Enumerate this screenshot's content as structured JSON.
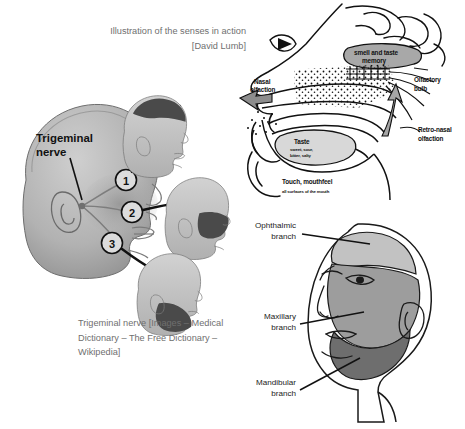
{
  "figure": {
    "background": "#ffffff",
    "width": 465,
    "height": 429
  },
  "captions": {
    "senses": "Illustration of the senses in action [David Lumb]",
    "trigeminal": "Trigeminal nerve [Images – Medical Dictionary – The Free Dictionary – Wikipedia]",
    "color": "#6f6f6f"
  },
  "senses_diagram": {
    "title": "hand-drawn sagittal section of head showing the senses in action",
    "labels": {
      "smell_taste_memory": "smell and taste memory",
      "nasal_olfaction": "Nasal olfaction",
      "olfactory_bulb": "Olfactory bulb",
      "retro_nasal_olfaction": "Retro-nasal olfaction",
      "taste": "Taste",
      "taste_qualities": "sweet, sour, bitter, salty",
      "touch_mouthfeel": "Touch, mouthfeel",
      "touch_surfaces": "all surfaces of the mouth"
    }
  },
  "trigeminal_diagram": {
    "title": "Trigeminal nerve",
    "nerve_label": "Trigeminal\nnerve",
    "markers": [
      {
        "number": "1",
        "branch": "ophthalmic"
      },
      {
        "number": "2",
        "branch": "maxillary"
      },
      {
        "number": "3",
        "branch": "mandibular"
      }
    ],
    "colors": {
      "head_fill": "#b9b9b9",
      "head_shadow": "#9a9a9a",
      "highlight": "#4d4d4d",
      "small_head_fill": "#c8c8c8",
      "connector": "#111111"
    }
  },
  "branches_diagram": {
    "labels": [
      {
        "name": "ophthalmic",
        "text": "Ophthalmic\nbranch"
      },
      {
        "name": "maxillary",
        "text": "Maxillary\nbranch"
      },
      {
        "name": "mandibular",
        "text": "Mandibular\nbranch"
      }
    ],
    "colors": {
      "ophthalmic_fill": "#c2c2c2",
      "maxillary_fill": "#9d9d9d",
      "mandibular_fill": "#6e6e6e",
      "outline": "#1a1a1a",
      "skin": "#ffffff"
    }
  }
}
